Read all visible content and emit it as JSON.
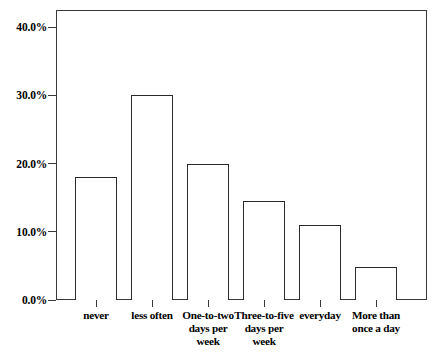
{
  "chart_data": {
    "type": "bar",
    "title": "",
    "subtitle": "",
    "xlabel": "",
    "ylabel": "",
    "categories": [
      "never",
      "less often",
      "One-to-two days per week",
      "Three-to-five days per week",
      "everyday",
      "More than once a day"
    ],
    "values": [
      18.0,
      30.0,
      20.0,
      14.5,
      11.0,
      4.8
    ],
    "ylim": [
      0,
      42.5
    ],
    "yticks": [
      0,
      10,
      20,
      30,
      40
    ],
    "ytick_labels": [
      "0.0%",
      "10.0%",
      "20.0%",
      "30.0%",
      "40.0%"
    ],
    "grid": false,
    "legend": null,
    "bar_fill_color": "#ffffff",
    "bar_edge_color": "#2b2b2b",
    "axis_color": "#3a3a3a",
    "background_color": "#ffffff"
  },
  "axes": {
    "y": {
      "ticks": [
        {
          "label": "40.0%",
          "value": 40
        },
        {
          "label": "30.0%",
          "value": 30
        },
        {
          "label": "20.0%",
          "value": 20
        },
        {
          "label": "10.0%",
          "value": 10
        },
        {
          "label": "0.0%",
          "value": 0
        }
      ]
    },
    "x": {
      "ticks": [
        {
          "label": "never",
          "value": 18.0
        },
        {
          "label": "less often",
          "value": 30.0
        },
        {
          "label": "One-to-two days per week",
          "value": 20.0
        },
        {
          "label": "Three-to-five days per week",
          "value": 14.5
        },
        {
          "label": "everyday",
          "value": 11.0
        },
        {
          "label": "More than once a day",
          "value": 4.8
        }
      ]
    }
  }
}
